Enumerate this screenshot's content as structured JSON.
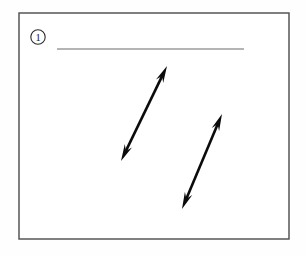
{
  "page": {
    "background_color": "#fefefe",
    "width": 305,
    "height": 255
  },
  "frame": {
    "name": "worksheet-frame",
    "x": 19,
    "y": 13,
    "width": 270,
    "height": 226,
    "stroke_color": "#4a4a4a",
    "fill_color": "#ffffff"
  },
  "item_marker": {
    "label": "1",
    "shape": "circle",
    "center_x": 38,
    "center_y": 37,
    "radius": 7.2,
    "stroke_color": "#2b2b2b"
  },
  "answer_rule": {
    "name": "answer-blank-line",
    "x1": 57,
    "y1": 49,
    "x2": 244,
    "y2": 49,
    "color": "#9b9b9b"
  },
  "figures": [
    {
      "id": "arrow-1",
      "label": "double-headed-arrow-left",
      "type": "double_arrow",
      "x1": 121,
      "y1": 161,
      "x2": 167,
      "y2": 66,
      "color": "#0b0b0b",
      "shaft_width": 2.6,
      "head_length": 17,
      "head_width": 8
    },
    {
      "id": "arrow-2",
      "label": "double-headed-arrow-right",
      "type": "double_arrow",
      "x1": 182,
      "y1": 209,
      "x2": 222,
      "y2": 114,
      "color": "#0b0b0b",
      "shaft_width": 2.6,
      "head_length": 17,
      "head_width": 8
    }
  ]
}
